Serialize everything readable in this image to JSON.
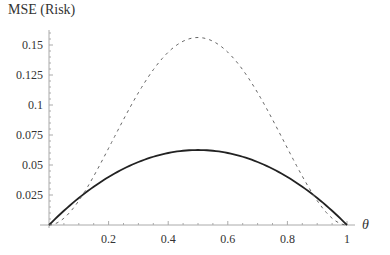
{
  "chart_data": {
    "type": "line",
    "title": "",
    "ylabel": "MSE (Risk)",
    "xlabel": "θ",
    "xlim": [
      0,
      1
    ],
    "ylim": [
      0,
      0.16
    ],
    "x_ticks": [
      "0.2",
      "0.4",
      "0.6",
      "0.8",
      "1"
    ],
    "y_ticks": [
      "0.025",
      "0.05",
      "0.075",
      "0.1",
      "0.125",
      "0.15"
    ],
    "grid": false,
    "legend": null,
    "series": [
      {
        "name": "solid",
        "style": "solid",
        "color": "#222222",
        "x": [
          0,
          0.1,
          0.2,
          0.3,
          0.4,
          0.5,
          0.6,
          0.7,
          0.8,
          0.9,
          1
        ],
        "values": [
          0,
          0.0225,
          0.04,
          0.0525,
          0.06,
          0.0625,
          0.06,
          0.0525,
          0.04,
          0.0225,
          0
        ]
      },
      {
        "name": "dashed",
        "style": "dashed",
        "color": "#666666",
        "x": [
          0,
          0.1,
          0.2,
          0.3,
          0.4,
          0.5,
          0.6,
          0.7,
          0.8,
          0.9,
          1
        ],
        "values": [
          0,
          0.0225,
          0.064,
          0.1103,
          0.1444,
          0.1563,
          0.1444,
          0.1103,
          0.064,
          0.0225,
          0
        ]
      }
    ]
  }
}
